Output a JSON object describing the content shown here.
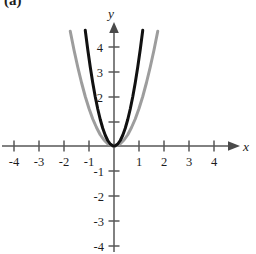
{
  "figure": {
    "panel_label": "(a)",
    "background_color": "#ffffff"
  },
  "axis_labels": {
    "x_name": "x",
    "y_name": "y"
  },
  "chart_data": {
    "type": "line",
    "title": "",
    "subtitle": "",
    "xlabel": "x",
    "ylabel": "y",
    "xlim": [
      -4.6,
      4.6
    ],
    "ylim": [
      -4.6,
      4.8
    ],
    "grid": false,
    "legend_position": "none",
    "axis_style": "cartesian-cross-with-arrows",
    "x_ticks": [
      -4,
      -3,
      -2,
      -1,
      1,
      2,
      3,
      4
    ],
    "x_tick_labels": [
      "-4",
      "-3",
      "-2",
      "-1",
      "1",
      "2",
      "3",
      "4"
    ],
    "y_ticks": [
      -4,
      -3,
      -2,
      -1,
      1,
      2,
      3,
      4
    ],
    "y_tick_labels": [
      "-4",
      "-3",
      "-2",
      "-1",
      "",
      "2",
      "3",
      "4"
    ],
    "unlabeled_y_ticks": [
      1
    ],
    "series": [
      {
        "name": "black-parabola",
        "equation": "y = 3.5x^2",
        "color": "#111111",
        "stroke_width": 3.0,
        "x": [
          -1.15,
          -1.05,
          -0.95,
          -0.85,
          -0.75,
          -0.65,
          -0.55,
          -0.45,
          -0.35,
          -0.25,
          -0.15,
          -0.05,
          0,
          0.05,
          0.15,
          0.25,
          0.35,
          0.45,
          0.55,
          0.65,
          0.75,
          0.85,
          0.95,
          1.05,
          1.15
        ],
        "values": [
          4.63,
          3.86,
          3.16,
          2.53,
          1.97,
          1.48,
          1.06,
          0.71,
          0.43,
          0.22,
          0.08,
          0.01,
          0,
          0.01,
          0.08,
          0.22,
          0.43,
          0.71,
          1.06,
          1.48,
          1.97,
          2.53,
          3.16,
          3.86,
          4.63
        ]
      },
      {
        "name": "gray-parabola",
        "equation": "y = 1.5x^2",
        "color": "#9d9d9d",
        "stroke_width": 3.0,
        "x": [
          -1.75,
          -1.6,
          -1.45,
          -1.3,
          -1.15,
          -1.0,
          -0.85,
          -0.7,
          -0.55,
          -0.4,
          -0.25,
          -0.1,
          0,
          0.1,
          0.25,
          0.4,
          0.55,
          0.7,
          0.85,
          1.0,
          1.15,
          1.3,
          1.45,
          1.6,
          1.75
        ],
        "values": [
          4.59,
          3.84,
          3.16,
          2.54,
          1.98,
          1.5,
          1.08,
          0.74,
          0.45,
          0.24,
          0.09,
          0.02,
          0,
          0.02,
          0.09,
          0.24,
          0.45,
          0.74,
          1.08,
          1.5,
          1.98,
          2.54,
          3.16,
          3.84,
          4.59
        ]
      }
    ],
    "annotations": []
  },
  "colors": {
    "axis": "#575757",
    "black_curve": "#111111",
    "gray_curve": "#9d9d9d",
    "text": "#1c1c1c"
  }
}
